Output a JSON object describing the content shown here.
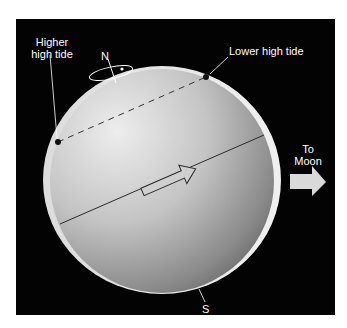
{
  "labels": {
    "higher_high_tide_line1": "Higher",
    "higher_high_tide_line2": "high tide",
    "lower_high_tide": "Lower high tide",
    "north": "N",
    "south": "S",
    "to_moon_line1": "To",
    "to_moon_line2": "Moon"
  },
  "colors": {
    "background": "#000000",
    "page": "#ffffff",
    "globe_light": "#e4e4e4",
    "globe_dark": "#6a6a6a",
    "tidal_bulge": "#e8e8e8",
    "arrow": "#d9d9d9",
    "text": "#ffffff"
  },
  "icons": {
    "rotation_indicator": "rotation-ellipse-icon",
    "moon_direction": "right-arrow-icon",
    "rotation_direction": "outline-arrow-icon"
  }
}
